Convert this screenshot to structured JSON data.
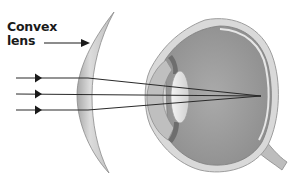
{
  "diagram": {
    "type": "optics-illustration",
    "labels": {
      "lens_label_line1": "Convex",
      "lens_label_line2": "lens"
    },
    "elements": {
      "lens": {
        "name": "convex-lens",
        "color": "#c8c8c8"
      },
      "eye": {
        "name": "eye-cross-section",
        "color": "#9a9a9a"
      },
      "rays": [
        {
          "name": "light-ray-top",
          "y": 78
        },
        {
          "name": "light-ray-middle",
          "y": 94
        },
        {
          "name": "light-ray-bottom",
          "y": 110
        }
      ],
      "focal_point": {
        "x": 261,
        "y": 96
      }
    },
    "colors": {
      "background": "#ffffff",
      "ray": "#2a2a2a",
      "lens_fill": "#cfcfcf",
      "eye_interior": "#a0a0a0",
      "sclera": "#d4d4d4"
    }
  }
}
